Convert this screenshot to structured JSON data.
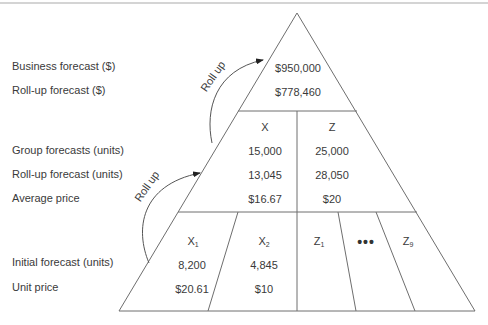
{
  "labels": {
    "business_forecast": "Business forecast ($)",
    "rollup_forecast_dollars": "Roll-up forecast ($)",
    "group_forecasts": "Group forecasts (units)",
    "rollup_forecast_units": "Roll-up forecast (units)",
    "average_price": "Average price",
    "initial_forecast": "Initial forecast (units)",
    "unit_price": "Unit price"
  },
  "arrows": {
    "upper": "Roll up",
    "lower": "Roll up"
  },
  "top_tier": {
    "business_forecast": "$950,000",
    "rollup_forecast": "$778,460"
  },
  "middle_tier": {
    "groups": [
      {
        "name": "X",
        "group_forecast": "15,000",
        "rollup_forecast": "13,045",
        "average_price": "$16.67"
      },
      {
        "name": "Z",
        "group_forecast": "25,000",
        "rollup_forecast": "28,050",
        "average_price": "$20"
      }
    ]
  },
  "bottom_tier": {
    "items": [
      {
        "name": "X",
        "sub": "1",
        "initial_forecast": "8,200",
        "unit_price": "$20.61"
      },
      {
        "name": "X",
        "sub": "2",
        "initial_forecast": "4,845",
        "unit_price": "$10"
      },
      {
        "name": "Z",
        "sub": "1"
      },
      {
        "name": "ellipsis",
        "text": "•••"
      },
      {
        "name": "Z",
        "sub": "9"
      }
    ]
  },
  "colors": {
    "line": "#6e6e6e",
    "text": "#3a3a3a"
  }
}
